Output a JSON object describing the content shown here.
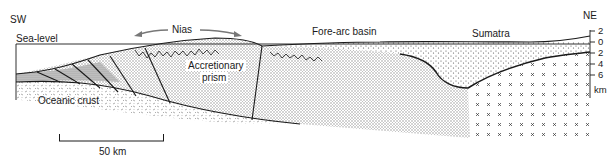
{
  "diagram": {
    "orientation": {
      "left": "SW",
      "right": "NE"
    },
    "labels": {
      "sea_level": "Sea-level",
      "nias": "Nias",
      "fore_arc_basin": "Fore-arc basin",
      "sumatra": "Sumatra",
      "accretionary_prism_line1": "Accretionary",
      "accretionary_prism_line2": "prism",
      "oceanic_crust": "Oceanic crust"
    },
    "depth_axis": {
      "ticks": [
        "2",
        "0",
        "2",
        "4",
        "6"
      ],
      "unit": "km"
    },
    "scale_bar": {
      "label": "50 km"
    },
    "colors": {
      "line": "#1a1a1a",
      "stipple": "#9a9a9a",
      "cross": "#333333",
      "background": "#ffffff"
    }
  }
}
